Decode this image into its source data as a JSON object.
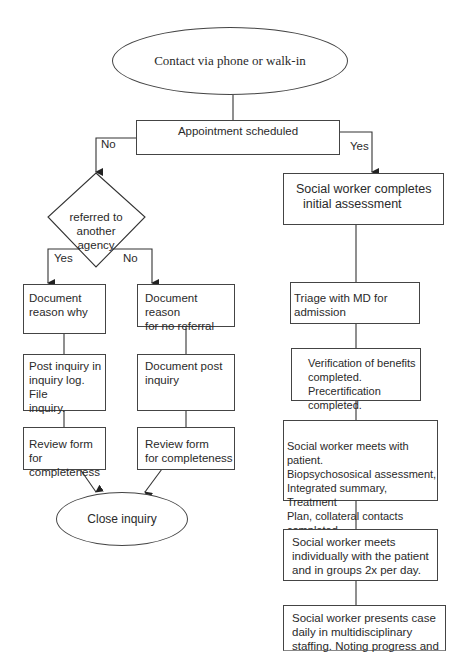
{
  "diagram": {
    "type": "flowchart",
    "start": {
      "label": "Contact via phone or walk-in"
    },
    "decision_appointment": {
      "label": "Appointment scheduled",
      "no_label": "No",
      "yes_label": "Yes"
    },
    "decision_referral": {
      "lines": [
        "referred to",
        "another",
        "agency"
      ],
      "yes_label": "Yes",
      "no_label": "No"
    },
    "left_branch": {
      "steps": [
        {
          "text": "Document\nreason why"
        },
        {
          "text": "Post inquiry in\ninquiry log.  File\ninquiry."
        },
        {
          "text": "Review form for\ncompleteness"
        }
      ]
    },
    "middle_branch": {
      "steps": [
        {
          "text": "Document reason\nfor no referral"
        },
        {
          "text": "Document post\ninquiry"
        },
        {
          "text": "Review form\nfor completeness"
        }
      ]
    },
    "end": {
      "label": "Close inquiry"
    },
    "right_branch": {
      "steps": [
        {
          "text": "Social worker completes\n  initial assessment"
        },
        {
          "text": "Triage with MD for admission"
        },
        {
          "text": "Verification of benefits\ncompleted.\nPrecertification completed."
        },
        {
          "text": "Social worker meets with patient.\nBiopsychososical assessment,\nIntegrated summary, Treatment\nPlan, collateral contacts completed."
        },
        {
          "text": "Social worker meets\nindividually with the patient\nand in groups 2x per day."
        },
        {
          "text": "Social worker presents case\ndaily in multidisciplinary\nstaffing. Noting progress and"
        }
      ]
    }
  }
}
